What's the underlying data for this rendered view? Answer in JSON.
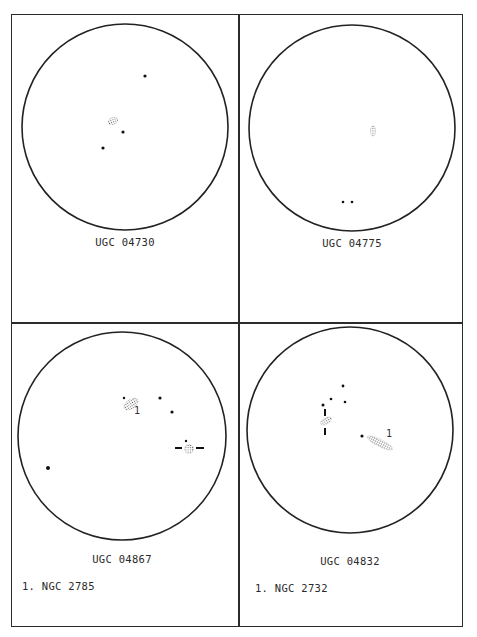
{
  "panels": [
    {
      "id": "UGC 04730",
      "title": "UGC 04730",
      "circle": {
        "cx": 125,
        "cy": 127,
        "r": 103
      },
      "label_pos": {
        "x": 125,
        "y": 236
      },
      "notes": [],
      "stars": [
        [
          145,
          76,
          1.6
        ],
        [
          123,
          132,
          1.6
        ],
        [
          103,
          148,
          1.6
        ]
      ],
      "galaxies": [
        {
          "cx": 113,
          "cy": 121,
          "rx": 5,
          "ry": 3.5,
          "rot": -20
        }
      ],
      "markers": [],
      "numbers": []
    },
    {
      "id": "UGC 04775",
      "title": "UGC 04775",
      "circle": {
        "cx": 352,
        "cy": 128,
        "r": 103
      },
      "label_pos": {
        "x": 352,
        "y": 237
      },
      "notes": [],
      "stars": [
        [
          343,
          202,
          1.3
        ],
        [
          352,
          202,
          1.3
        ]
      ],
      "galaxies": [
        {
          "cx": 373,
          "cy": 131,
          "rx": 2.5,
          "ry": 5,
          "rot": 0
        }
      ],
      "markers": [],
      "numbers": []
    },
    {
      "id": "UGC 04867",
      "title": "UGC 04867",
      "circle": {
        "cx": 122,
        "cy": 436,
        "r": 104
      },
      "label_pos": {
        "x": 122,
        "y": 553
      },
      "notes": [
        "1. NGC 2785"
      ],
      "note_pos": {
        "x": 22,
        "y": 580
      },
      "stars": [
        [
          124,
          398,
          1.2
        ],
        [
          160,
          398,
          1.6
        ],
        [
          172,
          412,
          1.6
        ],
        [
          48,
          468,
          2.0
        ],
        [
          186,
          441,
          1.2
        ]
      ],
      "galaxies": [
        {
          "cx": 131,
          "cy": 404,
          "rx": 8,
          "ry": 4.5,
          "rot": -35
        },
        {
          "cx": 189,
          "cy": 449,
          "rx": 4.5,
          "ry": 4.5,
          "rot": 0
        }
      ],
      "markers": [
        {
          "x1": 175,
          "y1": 448,
          "x2": 182,
          "y2": 448
        },
        {
          "x1": 196,
          "y1": 448,
          "x2": 204,
          "y2": 448
        }
      ],
      "numbers": [
        {
          "text": "1",
          "x": 134,
          "y": 414
        }
      ]
    },
    {
      "id": "UGC 04832",
      "title": "UGC 04832",
      "circle": {
        "cx": 350,
        "cy": 430,
        "r": 103
      },
      "label_pos": {
        "x": 350,
        "y": 555
      },
      "notes": [
        "1. NGC 2732"
      ],
      "note_pos": {
        "x": 255,
        "y": 582
      },
      "stars": [
        [
          343,
          386,
          1.4
        ],
        [
          331,
          399,
          1.3
        ],
        [
          345,
          402,
          1.3
        ],
        [
          323,
          405,
          1.5
        ],
        [
          362,
          436,
          1.6
        ]
      ],
      "galaxies": [
        {
          "cx": 326,
          "cy": 421,
          "rx": 6,
          "ry": 3,
          "rot": -30
        },
        {
          "cx": 380,
          "cy": 443,
          "rx": 14,
          "ry": 3.5,
          "rot": 27
        }
      ],
      "markers": [
        {
          "x1": 325,
          "y1": 409,
          "x2": 325,
          "y2": 416
        },
        {
          "x1": 325,
          "y1": 428,
          "x2": 325,
          "y2": 435
        }
      ],
      "numbers": [
        {
          "text": "1",
          "x": 386,
          "y": 437
        }
      ]
    }
  ]
}
